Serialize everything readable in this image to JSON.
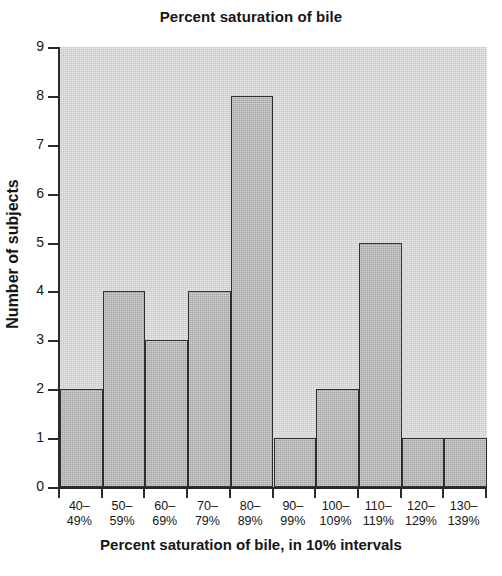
{
  "chart_data": {
    "type": "bar",
    "title": "Percent saturation of bile",
    "xlabel": "Percent saturation of bile, in 10% intervals",
    "ylabel": "Number of subjects",
    "categories": [
      "40–49%",
      "50–59%",
      "60–69%",
      "70–79%",
      "80–89%",
      "90–99%",
      "100–109%",
      "110–119%",
      "120–129%",
      "130–139%"
    ],
    "category_lines": [
      [
        "40–",
        "49%"
      ],
      [
        "50–",
        "59%"
      ],
      [
        "60–",
        "69%"
      ],
      [
        "70–",
        "79%"
      ],
      [
        "80–",
        "89%"
      ],
      [
        "90–",
        "99%"
      ],
      [
        "100–",
        "109%"
      ],
      [
        "110–",
        "119%"
      ],
      [
        "120–",
        "129%"
      ],
      [
        "130–",
        "139%"
      ]
    ],
    "values": [
      2,
      4,
      3,
      4,
      8,
      1,
      2,
      5,
      1,
      1
    ],
    "ylim": [
      0,
      9
    ],
    "ytick_labels": [
      "0",
      "1",
      "2",
      "3",
      "4",
      "5",
      "6",
      "7",
      "8",
      "9"
    ],
    "ytick_values": [
      0,
      1,
      2,
      3,
      4,
      5,
      6,
      7,
      8,
      9
    ],
    "grid": false,
    "legend": false,
    "bar_fill_color": "#b3b3b3",
    "bar_edge_color": "#2f2f2f",
    "plot_background_color": "#c9c9c9",
    "axis_color": "#2b2b2b",
    "text_color": "#161616",
    "page_background_color": "#ffffff"
  }
}
